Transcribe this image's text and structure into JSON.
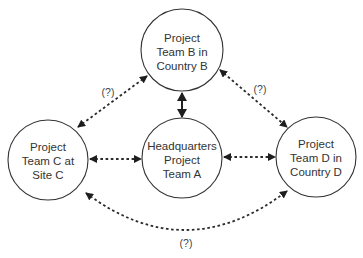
{
  "diagram": {
    "title": "",
    "colors": {
      "stroke": "#333333",
      "background": "#ffffff",
      "text": "#333333"
    },
    "nodes": [
      {
        "id": "B",
        "lines": [
          "Project",
          "Team B in",
          "Country B"
        ],
        "cx": 182,
        "cy": 50,
        "r": 41
      },
      {
        "id": "C",
        "lines": [
          "Project",
          "Team C at",
          "Site C"
        ],
        "cx": 48,
        "cy": 160,
        "r": 40
      },
      {
        "id": "A",
        "lines": [
          "Headquarters",
          "Project",
          "Team A"
        ],
        "cx": 182,
        "cy": 158,
        "r": 40
      },
      {
        "id": "D",
        "lines": [
          "Project",
          "Team D in",
          "Country D"
        ],
        "cx": 316,
        "cy": 157,
        "r": 40
      }
    ],
    "edges": [
      {
        "from": "C",
        "to": "B",
        "style": "dotted",
        "direction": "both",
        "label": "(?)"
      },
      {
        "from": "B",
        "to": "D",
        "style": "dotted",
        "direction": "both",
        "label": "(?)"
      },
      {
        "from": "B",
        "to": "A",
        "style": "solid",
        "direction": "both",
        "label": ""
      },
      {
        "from": "C",
        "to": "A",
        "style": "dotted",
        "direction": "both",
        "label": ""
      },
      {
        "from": "A",
        "to": "D",
        "style": "dotted",
        "direction": "both",
        "label": ""
      },
      {
        "from": "C",
        "to": "D",
        "style": "dotted-curved",
        "direction": "both",
        "label": "(?)"
      }
    ]
  }
}
